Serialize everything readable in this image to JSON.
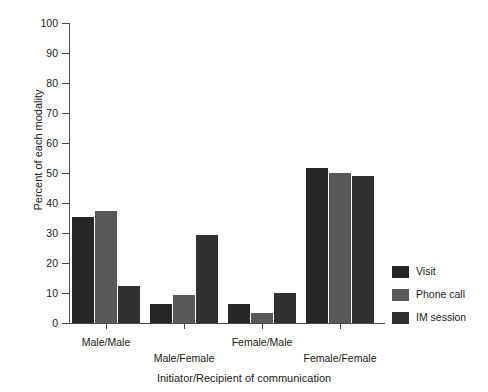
{
  "chart_data": {
    "type": "bar",
    "title": "",
    "xlabel": "Initiator/Recipient of communication",
    "ylabel": "Percent of each modality",
    "categories": [
      "Male/Male",
      "Male/Female",
      "Female/Male",
      "Female/Female"
    ],
    "series": [
      {
        "name": "Visit",
        "color": "#262626",
        "values": [
          35.3,
          6.5,
          6.5,
          51.6
        ]
      },
      {
        "name": "Phone call",
        "color": "#585858",
        "values": [
          37.5,
          9.5,
          3.4,
          50.0
        ]
      },
      {
        "name": "IM session",
        "color": "#303030",
        "values": [
          12.2,
          29.2,
          10.0,
          49.0
        ]
      }
    ],
    "ylim": [
      0,
      100
    ],
    "yticks": [
      0,
      10,
      20,
      30,
      40,
      50,
      60,
      70,
      80,
      90,
      100
    ],
    "ytick_labels": [
      "0",
      "10",
      "20",
      "30",
      "40",
      "50",
      "60",
      "70",
      "80",
      "90",
      "100"
    ],
    "grid": false,
    "legend_position": "right-bottom"
  },
  "axes": {
    "y_label": "Percent of each modality",
    "x_label": "Initiator/Recipient of communication"
  },
  "legend": {
    "items": [
      {
        "label": "Visit"
      },
      {
        "label": "Phone call"
      },
      {
        "label": "IM session"
      }
    ]
  },
  "groups": [
    {
      "label": "Male/Male"
    },
    {
      "label": "Male/Female"
    },
    {
      "label": "Female/Male"
    },
    {
      "label": "Female/Female"
    }
  ],
  "yticks": [
    {
      "label": "100"
    },
    {
      "label": "90"
    },
    {
      "label": "80"
    },
    {
      "label": "70"
    },
    {
      "label": "60"
    },
    {
      "label": "50"
    },
    {
      "label": "40"
    },
    {
      "label": "30"
    },
    {
      "label": "20"
    },
    {
      "label": "10"
    },
    {
      "label": "0"
    }
  ]
}
